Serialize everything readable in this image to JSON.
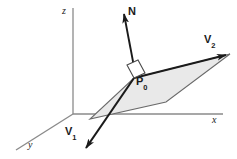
{
  "figure": {
    "background_color": "#ffffff",
    "stroke_color": "#1a1a1a",
    "axis_color": "#7a7a7a",
    "plane_fill_color": "#e9e9e9",
    "plane_edge_color": "#555555"
  },
  "axes": [
    {
      "name": "z-axis",
      "label": "z",
      "label_x": 62,
      "label_y": 7
    },
    {
      "name": "x-axis",
      "label": "x",
      "label_x": 212,
      "label_y": 116
    },
    {
      "name": "y-axis",
      "label": "y",
      "label_x": 28,
      "label_y": 140
    }
  ],
  "vectors": [
    {
      "name": "normal-vector",
      "label": "N",
      "subscript": "",
      "label_x": 128,
      "label_y": 6
    },
    {
      "name": "v1-vector",
      "label": "V",
      "subscript": "1",
      "label_x": 65,
      "label_y": 125
    },
    {
      "name": "v2-vector",
      "label": "V",
      "subscript": "2",
      "label_x": 205,
      "label_y": 34
    }
  ],
  "points": [
    {
      "name": "base-point",
      "label": "P",
      "subscript": "0",
      "label_x": 136,
      "label_y": 76
    }
  ],
  "markers": [
    {
      "name": "right-angle-marker",
      "description": "square denoting perpendicularity of N to plane"
    }
  ]
}
